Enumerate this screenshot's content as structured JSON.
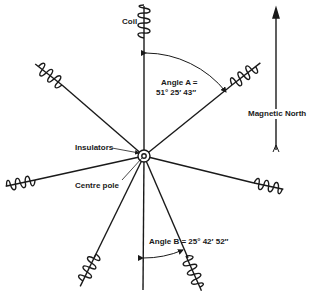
{
  "diagram": {
    "labels": {
      "coil": "Coil",
      "angle_a_title": "Angle A =",
      "angle_a_value": "51° 25′ 43″",
      "magnetic_north": "Magnetic North",
      "insulators": "Insulators",
      "centre_pole": "Centre pole",
      "angle_b": "Angle B = 25° 42′ 52″"
    },
    "center": [
      144,
      156
    ],
    "spokes": [
      {
        "name": "north",
        "end": [
          144,
          8
        ],
        "coil_start": 40
      },
      {
        "name": "north-east",
        "end": [
          258,
          64
        ],
        "coil_start": 232
      },
      {
        "name": "east",
        "end": [
          283,
          190
        ],
        "coil_start": 254
      },
      {
        "name": "south-east",
        "end": [
          206,
          290
        ],
        "coil_start": 190
      },
      {
        "name": "south",
        "end": [
          143,
          296
        ],
        "coil_start": null
      },
      {
        "name": "south-west",
        "end": [
          76,
          288
        ],
        "coil_start": 94
      },
      {
        "name": "west",
        "end": [
          5,
          183
        ],
        "coil_start": 35
      },
      {
        "name": "north-west",
        "end": [
          36,
          58
        ],
        "coil_start": 60
      }
    ],
    "colors": {
      "ink": "#1a1a1a",
      "background": "#ffffff"
    }
  }
}
